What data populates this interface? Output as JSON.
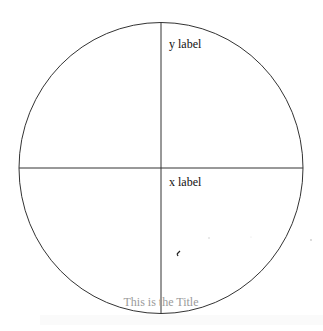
{
  "diagram": {
    "title": "This is the Title",
    "x_label": "x label",
    "y_label": "y label",
    "shape": "circle",
    "axes": [
      "horizontal",
      "vertical"
    ],
    "colors": {
      "stroke": "#333333",
      "label": "#111111",
      "title": "#9a9a9a",
      "marker": "#222222",
      "faint_dot": "#cccccc"
    }
  }
}
